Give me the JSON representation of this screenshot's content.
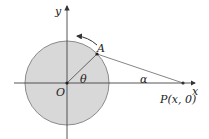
{
  "diagram": {
    "type": "geometry",
    "labels": {
      "y_axis": "y",
      "x_axis": "x",
      "origin": "O",
      "point_a": "A",
      "point_p": "P(x, 0)",
      "angle_theta": "θ",
      "angle_alpha": "α"
    },
    "colors": {
      "circle_fill": "#d8d8d8",
      "circle_stroke": "#8a8a8a",
      "axis": "#444444",
      "segment": "#555555",
      "point": "#222222"
    }
  }
}
